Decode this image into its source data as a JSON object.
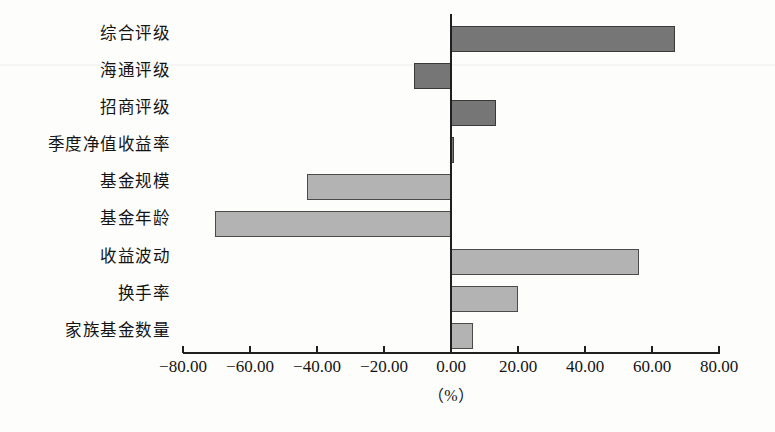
{
  "chart_data": {
    "type": "bar",
    "orientation": "horizontal",
    "title": "",
    "subtitle": "",
    "xlabel": "（%）",
    "ylabel": "",
    "categories": [
      "综合评级",
      "海通评级",
      "招商评级",
      "季度净值收益率",
      "基金规模",
      "基金年龄",
      "收益波动",
      "换手率",
      "家族基金数量"
    ],
    "values": [
      67.0,
      -11.0,
      13.5,
      0.7,
      -43.0,
      -70.5,
      56.0,
      20.0,
      6.5
    ],
    "series": [
      {
        "name": "",
        "values": [
          67.0,
          -11.0,
          13.5,
          0.7,
          -43.0,
          -70.5,
          56.0,
          20.0,
          6.5
        ]
      }
    ],
    "bar_colors": [
      "#767676",
      "#767676",
      "#767676",
      "#767676",
      "#b3b3b3",
      "#b3b3b3",
      "#b3b3b3",
      "#b3b3b3",
      "#b3b3b3"
    ],
    "xlim": [
      -80.0,
      80.0
    ],
    "xtick_values": [
      -80.0,
      -60.0,
      -40.0,
      -20.0,
      0.0,
      20.0,
      40.0,
      60.0,
      80.0
    ],
    "xtick_labels": [
      "−80.00",
      "−60.00",
      "−40.00",
      "−20.00",
      "0.00",
      "20.00",
      "40.00",
      "60.00",
      "80.00"
    ],
    "grid": false,
    "legend": null,
    "legend_position": "none",
    "zero_line": true,
    "annotations": []
  },
  "colors": {
    "bar_dark": "#767676",
    "bar_light": "#b3b3b3",
    "bar_border": "#3a3a3a",
    "axis": "#1f1f1f",
    "text": "#141414",
    "background": "#fdfdfb"
  }
}
